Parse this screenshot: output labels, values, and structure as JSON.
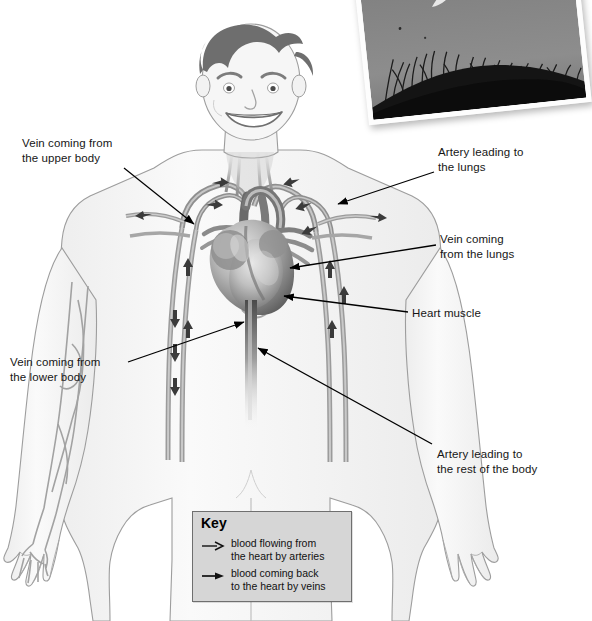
{
  "diagram": {
    "labels": [
      {
        "id": "vein-upper-body",
        "text": "Vein coming from\nthe upper body",
        "x": 22,
        "y": 136
      },
      {
        "id": "artery-lungs",
        "text": "Artery leading to\nthe lungs",
        "x": 438,
        "y": 145
      },
      {
        "id": "vein-lungs",
        "text": "Vein coming\nfrom the lungs",
        "x": 440,
        "y": 232
      },
      {
        "id": "heart-muscle",
        "text": "Heart muscle",
        "x": 412,
        "y": 306
      },
      {
        "id": "vein-lower-body",
        "text": "Vein coming from\nthe lower body",
        "x": 10,
        "y": 355
      },
      {
        "id": "artery-rest-body",
        "text": "Artery leading to\nthe rest of the body",
        "x": 437,
        "y": 447
      }
    ],
    "key": {
      "title": "Key",
      "entries": [
        {
          "id": "arteries",
          "arrow": "open-arrow-icon",
          "text": "blood flowing from\nthe heart by arteries"
        },
        {
          "id": "veins",
          "arrow": "solid-arrow-icon",
          "text": "blood coming back\nto the heart by veins"
        }
      ]
    },
    "photo": {
      "id": "athlete-photo",
      "description": "black and white photograph of a person jumping above grass"
    },
    "colors": {
      "body_fill": "#f4f4f4",
      "body_outline": "#9a9a9a",
      "vessel": "#8c8c8c",
      "vessel_dark": "#5e5e5e",
      "heart_dark": "#5a5a5a",
      "heart_light": "#d9d9d9",
      "hair": "#6e6e6e",
      "key_bg": "#d6d6d6",
      "key_border": "#6f6f6f",
      "leader_line": "#000000",
      "text": "#161616"
    }
  }
}
